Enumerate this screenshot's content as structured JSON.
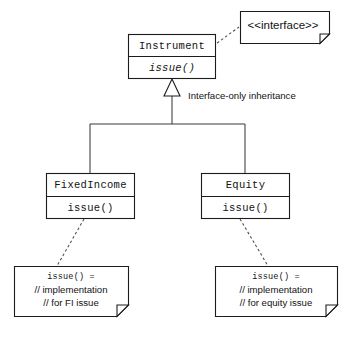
{
  "diagram": {
    "type": "uml-class-diagram",
    "title": "Interface-only Inheritance",
    "background_color": "#ffffff",
    "line_color": "#1c1c1c",
    "text_color": "#121212"
  },
  "classes": [
    {
      "id": "instrument",
      "name": "Instrument",
      "name_style": "monospace",
      "abstract": true,
      "methods": [
        {
          "signature": "issue()",
          "style": "italic-monospace"
        }
      ]
    },
    {
      "id": "fixedincome",
      "name": "FixedIncome",
      "name_style": "monospace",
      "abstract": false,
      "methods": [
        {
          "signature": "issue()",
          "style": "monospace"
        }
      ]
    },
    {
      "id": "equity",
      "name": "Equity",
      "name_style": "monospace",
      "abstract": false,
      "methods": [
        {
          "signature": "issue()",
          "style": "monospace"
        }
      ]
    }
  ],
  "notes": [
    {
      "id": "interface-note",
      "attached_to": "instrument",
      "lines": [
        {
          "text": "<<interface>>",
          "style": "sans"
        }
      ]
    },
    {
      "id": "fi-note",
      "attached_to": "fixedincome",
      "lines": [
        {
          "text": "issue() =",
          "style": "mono"
        },
        {
          "text": "// implementation",
          "style": "sans"
        },
        {
          "text": "// for FI issue",
          "style": "sans"
        }
      ]
    },
    {
      "id": "equity-note",
      "attached_to": "equity",
      "lines": [
        {
          "text": "issue() =",
          "style": "mono"
        },
        {
          "text": "// implementation",
          "style": "sans"
        },
        {
          "text": "// for equity issue",
          "style": "sans"
        }
      ]
    }
  ],
  "labels": {
    "inheritance": "Interface-only inheritance"
  },
  "relationships": [
    {
      "from": "fixedincome",
      "to": "instrument",
      "kind": "generalization",
      "line": "solid",
      "arrow": "hollow-triangle"
    },
    {
      "from": "equity",
      "to": "instrument",
      "kind": "generalization",
      "line": "solid",
      "arrow": "hollow-triangle"
    },
    {
      "from": "interface-note",
      "to": "instrument",
      "kind": "note-anchor",
      "line": "dashed",
      "arrow": "none"
    },
    {
      "from": "fi-note",
      "to": "fixedincome",
      "kind": "note-anchor",
      "line": "dashed",
      "arrow": "none"
    },
    {
      "from": "equity-note",
      "to": "equity",
      "kind": "note-anchor",
      "line": "dashed",
      "arrow": "none"
    }
  ]
}
